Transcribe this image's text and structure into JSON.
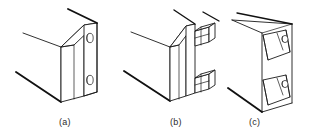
{
  "figure": {
    "type": "isometric-technical-line-drawing",
    "background_color": "#ffffff",
    "line_color": "#1a1a1a",
    "fill_color": "#ffffff",
    "panel_count": 3,
    "captions": [
      {
        "id": "a",
        "label": "(a)",
        "x": 59,
        "y": 117,
        "description": "Flat bracket plate with two round through-holes fastened flush against the panel edge"
      },
      {
        "id": "b",
        "label": "(b)",
        "x": 170,
        "y": 117,
        "description": "Panel edge with two protruding rectangular locking tabs / clips extending outward"
      },
      {
        "id": "c",
        "label": "(c)",
        "x": 249,
        "y": 117,
        "description": "Channel section with two angled folded-over gusset tabs each pierced by a round hole"
      }
    ],
    "views": [
      {
        "id": "a",
        "name": "bracket-plate-with-holes",
        "hole_count": 2,
        "hole_shape": "ellipse",
        "holes": [
          {
            "index": 1,
            "cx": 71,
            "cy": 37,
            "rx": 3.1,
            "ry": 4.6
          },
          {
            "index": 2,
            "cx": 71,
            "cy": 85,
            "rx": 3.1,
            "ry": 4.6
          }
        ]
      },
      {
        "id": "b",
        "name": "panel-edge-with-locking-tabs",
        "tab_count": 2,
        "tab_shape": "rectangular-block",
        "tabs": [
          {
            "index": 1,
            "x": 183,
            "y": 26
          },
          {
            "index": 2,
            "x": 183,
            "y": 78
          }
        ]
      },
      {
        "id": "c",
        "name": "channel-with-folded-gusset-tabs",
        "tab_count": 2,
        "tab_shape": "angled-folded-gusset",
        "hole_count": 2,
        "tabs": [
          {
            "index": 1,
            "x": 268,
            "y": 38
          },
          {
            "index": 2,
            "x": 268,
            "y": 84
          }
        ]
      }
    ]
  }
}
